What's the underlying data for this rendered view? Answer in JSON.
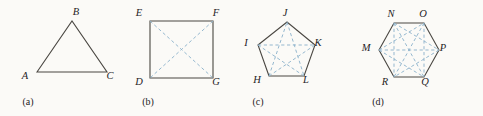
{
  "figure": {
    "background_color": "#fbfaf7",
    "outline_color": "#4a4742",
    "diagonal_color": "#8fb4cc",
    "label_color": "#26231f",
    "panels": [
      {
        "caption": "(a)",
        "caption_pos": [
          28,
          105
        ],
        "shape": "triangle",
        "sides": 3,
        "diagonal_count": 0,
        "vertices": [
          {
            "label": "A",
            "point": [
              37,
              72
            ],
            "label_pos": [
              25,
              79
            ]
          },
          {
            "label": "B",
            "point": [
              72,
              21
            ],
            "label_pos": [
              76,
              15
            ]
          },
          {
            "label": "C",
            "point": [
              107,
              72
            ],
            "label_pos": [
              110,
              79
            ]
          }
        ],
        "diagonals": []
      },
      {
        "caption": "(b)",
        "caption_pos": [
          148,
          105
        ],
        "shape": "square",
        "sides": 4,
        "diagonal_count": 2,
        "vertices": [
          {
            "label": "D",
            "point": [
              150,
              78
            ],
            "label_pos": [
              139,
              85
            ]
          },
          {
            "label": "E",
            "point": [
              150,
              21
            ],
            "label_pos": [
              139,
              16
            ]
          },
          {
            "label": "F",
            "point": [
              213,
              21
            ],
            "label_pos": [
              216,
              16
            ]
          },
          {
            "label": "G",
            "point": [
              213,
              78
            ],
            "label_pos": [
              216,
              85
            ]
          }
        ],
        "diagonals": [
          [
            "E",
            "G"
          ],
          [
            "F",
            "D"
          ]
        ]
      },
      {
        "caption": "(c)",
        "caption_pos": [
          258,
          105
        ],
        "shape": "pentagon",
        "sides": 5,
        "diagonal_count": 5,
        "vertices": [
          {
            "label": "H",
            "point": [
              269,
              76
            ],
            "label_pos": [
              257,
              83
            ]
          },
          {
            "label": "I",
            "point": [
              258,
              45
            ],
            "label_pos": [
              246,
              46
            ]
          },
          {
            "label": "J",
            "point": [
              287,
              22
            ],
            "label_pos": [
              285,
              16
            ]
          },
          {
            "label": "K",
            "point": [
              315,
              45
            ],
            "label_pos": [
              318,
              46
            ]
          },
          {
            "label": "L",
            "point": [
              304,
              76
            ],
            "label_pos": [
              306,
              83
            ]
          }
        ],
        "diagonals": [
          [
            "H",
            "J"
          ],
          [
            "H",
            "K"
          ],
          [
            "I",
            "K"
          ],
          [
            "I",
            "L"
          ],
          [
            "J",
            "L"
          ]
        ]
      },
      {
        "caption": "(d)",
        "caption_pos": [
          378,
          105
        ],
        "shape": "hexagon",
        "sides": 6,
        "diagonal_count": 9,
        "vertices": [
          {
            "label": "M",
            "point": [
              379,
              50
            ],
            "label_pos": [
              366,
              51
            ]
          },
          {
            "label": "N",
            "point": [
              394,
              23
            ],
            "label_pos": [
              391,
              17
            ]
          },
          {
            "label": "O",
            "point": [
              424,
              23
            ],
            "label_pos": [
              423,
              17
            ]
          },
          {
            "label": "P",
            "point": [
              439,
              50
            ],
            "label_pos": [
              443,
              51
            ]
          },
          {
            "label": "Q",
            "point": [
              424,
              77
            ],
            "label_pos": [
              425,
              85
            ]
          },
          {
            "label": "R",
            "point": [
              394,
              77
            ],
            "label_pos": [
              385,
              85
            ]
          }
        ],
        "diagonals": [
          [
            "M",
            "O"
          ],
          [
            "M",
            "P"
          ],
          [
            "M",
            "Q"
          ],
          [
            "N",
            "P"
          ],
          [
            "N",
            "Q"
          ],
          [
            "N",
            "R"
          ],
          [
            "O",
            "Q"
          ],
          [
            "O",
            "R"
          ],
          [
            "P",
            "R"
          ]
        ]
      }
    ]
  }
}
